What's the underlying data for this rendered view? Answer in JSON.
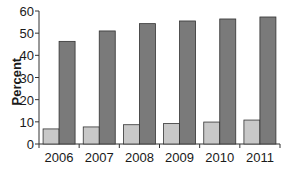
{
  "chart_data": {
    "type": "bar",
    "title": "",
    "xlabel": "",
    "ylabel": "Percent",
    "ylim": [
      0,
      60
    ],
    "yticks": [
      0,
      10,
      20,
      30,
      40,
      50,
      60
    ],
    "grid": false,
    "legend": null,
    "categories": [
      "2006",
      "2007",
      "2008",
      "2009",
      "2010",
      "2011"
    ],
    "series": [
      {
        "name": "Series 1 (light)",
        "color": "#c8c8c8",
        "values": [
          6.8,
          7.7,
          8.7,
          9.2,
          9.9,
          10.8
        ]
      },
      {
        "name": "Series 2 (dark)",
        "color": "#7a7a7a",
        "values": [
          46.3,
          51.0,
          54.3,
          55.5,
          56.4,
          57.3
        ]
      }
    ]
  }
}
